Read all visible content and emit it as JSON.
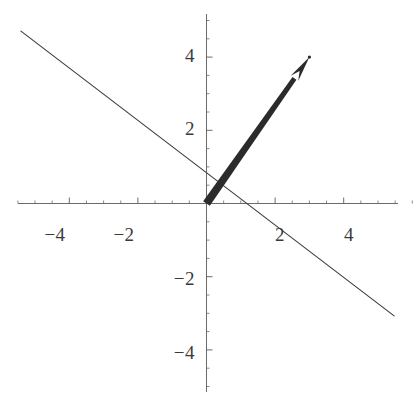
{
  "figure": {
    "width": 415,
    "height": 406,
    "background": "#ffffff",
    "axis_color": "#6b6b6b",
    "line_color": "#3f3f3f",
    "vector_color": "#2b2b2b",
    "label_color": "#3a3a3a"
  },
  "chart_data": {
    "type": "line",
    "title": "",
    "xlabel": "",
    "ylabel": "",
    "xlim": [
      -5.55,
      6.15
    ],
    "ylim": [
      -5.2,
      5.18
    ],
    "grid": false,
    "legend": null,
    "axes": {
      "x_axis_y": 0,
      "y_axis_x": 0,
      "x_ticks": [
        -4,
        -2,
        2,
        4
      ],
      "x_tick_labels": [
        "-4",
        "-2",
        "2",
        "4"
      ],
      "y_ticks": [
        4,
        2,
        -2,
        -4
      ],
      "y_tick_labels": [
        "4",
        "2",
        "-2",
        "-4"
      ],
      "minor_tick_step": 0.5
    },
    "series": [
      {
        "name": "vector",
        "type": "arrow",
        "style": "thick-arrow",
        "x": [
          0,
          3
        ],
        "y": [
          0,
          4
        ],
        "start": [
          0,
          0
        ],
        "end": [
          3,
          4
        ],
        "thickness": 7,
        "arrowhead": true
      },
      {
        "name": "orthogonal-line",
        "type": "line",
        "style": "thin-line",
        "slope": -0.72,
        "intercept": 0.82,
        "x": [
          -5.41,
          5.47
        ],
        "y": [
          4.71,
          -3.07
        ],
        "thickness": 1
      }
    ]
  },
  "labels": {
    "x": [
      {
        "text": "-4",
        "value": -4,
        "px": 55,
        "py": 224
      },
      {
        "text": "-2",
        "value": -2,
        "px": 124,
        "py": 224
      },
      {
        "text": "2",
        "value": 2,
        "px": 280,
        "py": 224
      },
      {
        "text": "4",
        "value": 4,
        "px": 349,
        "py": 224
      }
    ],
    "y": [
      {
        "text": "4",
        "value": 4,
        "px": 195,
        "py": 56
      },
      {
        "text": "2",
        "value": 2,
        "px": 195,
        "py": 129
      },
      {
        "text": "-2",
        "value": -2,
        "px": 195,
        "py": 279
      },
      {
        "text": "-4",
        "value": -4,
        "px": 195,
        "py": 353
      }
    ]
  }
}
